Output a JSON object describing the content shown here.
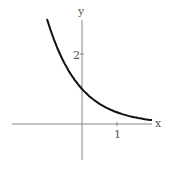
{
  "chart_data": {
    "type": "line",
    "title": "",
    "xlabel": "x",
    "ylabel": "y",
    "x_ticks": [
      "1"
    ],
    "y_ticks": [
      "2"
    ],
    "xlim": [
      -2,
      2
    ],
    "ylim": [
      -1,
      3
    ],
    "grid": false,
    "series": [
      {
        "name": "curve",
        "x": [
          -1,
          -0.5,
          0,
          0.5,
          1,
          1.5,
          2
        ],
        "y": [
          3.0,
          1.73,
          1.0,
          0.58,
          0.33,
          0.19,
          0.11
        ]
      }
    ]
  },
  "labels": {
    "x_axis": "x",
    "y_axis": "y",
    "x_tick": "1",
    "y_tick": "2"
  }
}
